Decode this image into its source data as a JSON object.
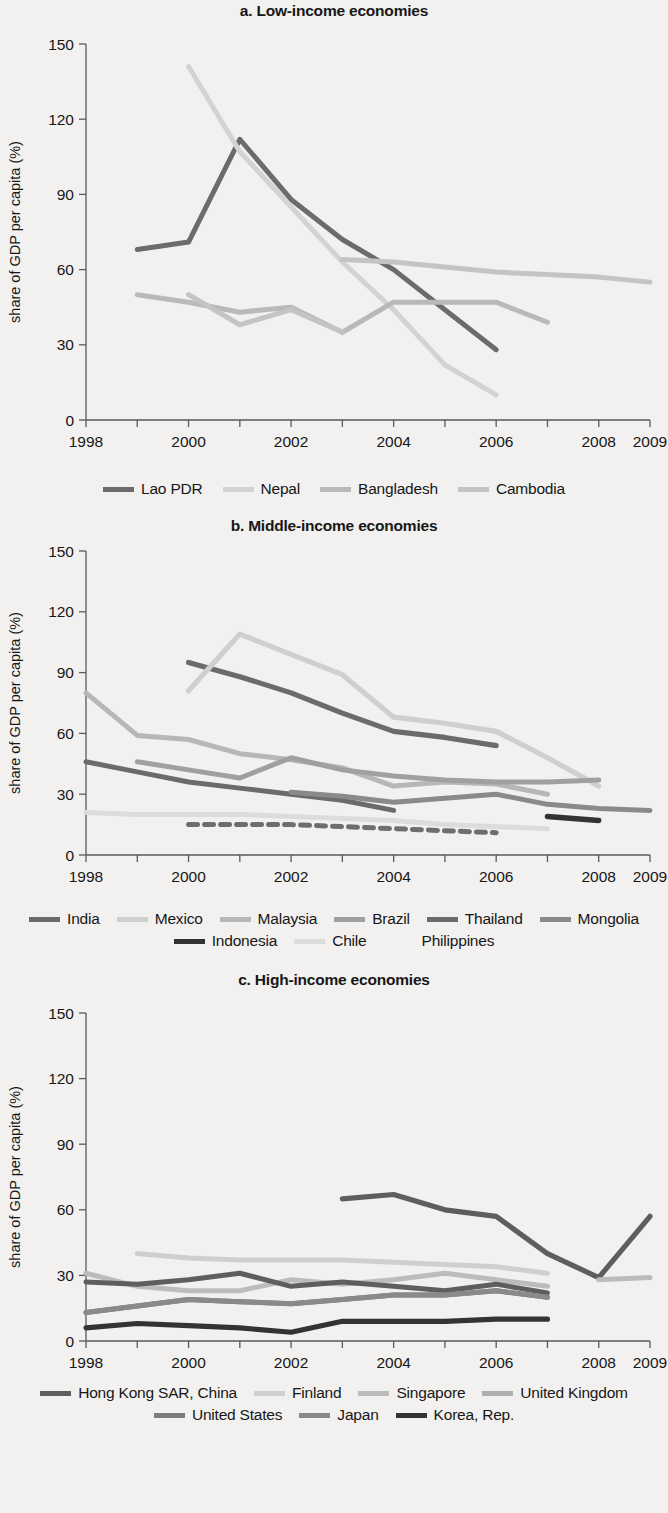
{
  "figure": {
    "y_axis_label": "share of GDP per capita (%)",
    "y_ticks": [
      "0",
      "30",
      "60",
      "90",
      "120",
      "150"
    ],
    "x_ticks": [
      "1998",
      "2000",
      "2002",
      "2004",
      "2006",
      "2008",
      "2009"
    ]
  },
  "chart_data": [
    {
      "type": "line",
      "title": "a. Low-income economies",
      "xlabel": "",
      "ylabel": "share of GDP per capita (%)",
      "xlim": [
        1998,
        2009
      ],
      "ylim": [
        0,
        150
      ],
      "ytick_values": [
        0,
        30,
        60,
        90,
        120,
        150
      ],
      "xtick_values": [
        1998,
        1999,
        2000,
        2001,
        2002,
        2003,
        2004,
        2005,
        2006,
        2007,
        2008,
        2009
      ],
      "xtick_labels": [
        "1998",
        "",
        "2000",
        "",
        "2002",
        "",
        "2004",
        "",
        "2006",
        "",
        "2008",
        "2009"
      ],
      "grid": false,
      "legend_position": "bottom",
      "series": [
        {
          "name": "Lao PDR",
          "color": "#6b6b6d",
          "style": "solid",
          "width": 5.0,
          "x": [
            1999,
            2000,
            2001,
            2002,
            2003,
            2004,
            2005,
            2006
          ],
          "values": [
            68,
            71,
            112,
            88,
            72,
            60,
            44,
            28
          ]
        },
        {
          "name": "Nepal",
          "color": "#d3d3d2",
          "style": "solid",
          "width": 5.0,
          "x": [
            2000,
            2001,
            2002,
            2003,
            2004,
            2005,
            2006
          ],
          "values": [
            141,
            107,
            85,
            63,
            44,
            22,
            10
          ]
        },
        {
          "name": "Bangladesh",
          "color": "#b9b9b8",
          "style": "solid",
          "width": 5.0,
          "x": [
            2003,
            2004,
            2005,
            2006,
            2007
          ],
          "values": [
            35,
            47,
            47,
            47,
            39
          ]
        },
        {
          "name": "Cambodia",
          "color": "#c4c4c3",
          "style": "solid",
          "width": 5.0,
          "x": [
            2003,
            2004,
            2005,
            2006,
            2007,
            2008,
            2009
          ],
          "values": [
            64,
            63,
            61,
            59,
            58,
            57,
            55
          ]
        },
        {
          "name": "Bangladesh-early",
          "color": "#b9b9b8",
          "style": "solid",
          "width": 5.0,
          "hidden_from_legend": true,
          "x": [
            1999,
            2000,
            2001,
            2002,
            2003
          ],
          "values": [
            50,
            47,
            43,
            45,
            35
          ]
        },
        {
          "name": "Cambodia-early",
          "color": "#c4c4c3",
          "style": "solid",
          "width": 5.0,
          "hidden_from_legend": true,
          "x": [
            2000,
            2001,
            2002,
            2003
          ],
          "values": [
            50,
            38,
            44,
            35
          ]
        }
      ],
      "legend": [
        {
          "label": "Lao PDR",
          "color": "#6b6b6d",
          "style": "solid"
        },
        {
          "label": "Nepal",
          "color": "#d3d3d2",
          "style": "solid"
        },
        {
          "label": "Bangladesh",
          "color": "#b9b9b8",
          "style": "solid"
        },
        {
          "label": "Cambodia",
          "color": "#c4c4c3",
          "style": "solid"
        }
      ]
    },
    {
      "type": "line",
      "title": "b. Middle-income economies",
      "xlabel": "",
      "ylabel": "share of GDP per capita (%)",
      "xlim": [
        1998,
        2009
      ],
      "ylim": [
        0,
        150
      ],
      "ytick_values": [
        0,
        30,
        60,
        90,
        120,
        150
      ],
      "xtick_values": [
        1998,
        1999,
        2000,
        2001,
        2002,
        2003,
        2004,
        2005,
        2006,
        2007,
        2008,
        2009
      ],
      "xtick_labels": [
        "1998",
        "",
        "2000",
        "",
        "2002",
        "",
        "2004",
        "",
        "2006",
        "",
        "2008",
        "2009"
      ],
      "grid": false,
      "legend_position": "bottom",
      "series": [
        {
          "name": "India",
          "color": "#6b6b6d",
          "style": "solid",
          "width": 5.2,
          "x": [
            2000,
            2001,
            2002,
            2003,
            2004,
            2005,
            2006
          ],
          "values": [
            95,
            88,
            80,
            70,
            61,
            58,
            54
          ]
        },
        {
          "name": "Mexico",
          "color": "#cfcfce",
          "style": "solid",
          "width": 5.2,
          "x": [
            2000,
            2001,
            2002,
            2003,
            2004,
            2005,
            2006,
            2007,
            2008
          ],
          "values": [
            81,
            109,
            99,
            89,
            68,
            65,
            61,
            48,
            34
          ]
        },
        {
          "name": "Malaysia",
          "color": "#b7b7b6",
          "style": "solid",
          "width": 5.0,
          "x": [
            1998,
            1999,
            2000,
            2001,
            2002,
            2003,
            2004,
            2005,
            2006,
            2007
          ],
          "values": [
            80,
            59,
            57,
            50,
            47,
            43,
            34,
            36,
            35,
            30
          ]
        },
        {
          "name": "Brazil",
          "color": "#a0a0a0",
          "style": "solid",
          "width": 5.0,
          "x": [
            1999,
            2000,
            2001,
            2002,
            2003,
            2004,
            2005,
            2006,
            2007,
            2008
          ],
          "values": [
            46,
            42,
            38,
            48,
            42,
            39,
            37,
            36,
            36,
            37
          ]
        },
        {
          "name": "Thailand",
          "color": "#6b6b6d",
          "style": "solid",
          "width": 5.0,
          "x": [
            1998,
            1999,
            2000,
            2001,
            2002,
            2003,
            2004
          ],
          "values": [
            46,
            41,
            36,
            33,
            30,
            27,
            22
          ]
        },
        {
          "name": "Mongolia",
          "color": "#8a8a8a",
          "style": "solid",
          "width": 5.0,
          "x": [
            2002,
            2003,
            2004,
            2005,
            2006,
            2007,
            2008,
            2009
          ],
          "values": [
            31,
            29,
            26,
            28,
            30,
            25,
            23,
            22
          ]
        },
        {
          "name": "Indonesia",
          "color": "#333334",
          "style": "solid",
          "width": 5.4,
          "x": [
            2007,
            2008
          ],
          "values": [
            19,
            17
          ]
        },
        {
          "name": "Chile",
          "color": "#dcdcdb",
          "style": "solid",
          "width": 5.0,
          "x": [
            1998,
            1999,
            2000,
            2001,
            2002,
            2003,
            2004,
            2005,
            2006,
            2007
          ],
          "values": [
            21,
            20,
            20,
            20,
            19,
            18,
            17,
            15,
            14,
            13
          ]
        },
        {
          "name": "Philippines",
          "color": "#6e6e70",
          "style": "dashed",
          "width": 5.0,
          "x": [
            2000,
            2001,
            2002,
            2003,
            2004,
            2005,
            2006
          ],
          "values": [
            15,
            15,
            15,
            14,
            13,
            12,
            11
          ]
        }
      ],
      "legend": [
        {
          "label": "India",
          "color": "#6b6b6d",
          "style": "solid"
        },
        {
          "label": "Mexico",
          "color": "#cfcfce",
          "style": "solid"
        },
        {
          "label": "Malaysia",
          "color": "#b7b7b6",
          "style": "solid"
        },
        {
          "label": "Brazil",
          "color": "#a0a0a0",
          "style": "solid"
        },
        {
          "label": "Thailand",
          "color": "#6b6b6d",
          "style": "solid"
        },
        {
          "label": "Mongolia",
          "color": "#8a8a8a",
          "style": "solid"
        },
        {
          "label": "Indonesia",
          "color": "#333334",
          "style": "solid"
        },
        {
          "label": "Chile",
          "color": "#dcdcdb",
          "style": "solid"
        },
        {
          "label": "Philippines",
          "color": "#6e6e70",
          "style": "dashed"
        }
      ]
    },
    {
      "type": "line",
      "title": "c. High-income economies",
      "xlabel": "",
      "ylabel": "share of GDP per capita (%)",
      "xlim": [
        1998,
        2009
      ],
      "ylim": [
        0,
        150
      ],
      "ytick_values": [
        0,
        30,
        60,
        90,
        120,
        150
      ],
      "xtick_values": [
        1998,
        1999,
        2000,
        2001,
        2002,
        2003,
        2004,
        2005,
        2006,
        2007,
        2008,
        2009
      ],
      "xtick_labels": [
        "1998",
        "",
        "2000",
        "",
        "2002",
        "",
        "2004",
        "",
        "2006",
        "",
        "2008",
        "2009"
      ],
      "grid": false,
      "legend_position": "bottom",
      "series": [
        {
          "name": "Hong Kong SAR, China",
          "color": "#5e5e60",
          "style": "solid",
          "width": 5.2,
          "x": [
            2003,
            2004,
            2005,
            2006,
            2007,
            2008,
            2009
          ],
          "values": [
            65,
            67,
            60,
            57,
            40,
            29,
            57
          ]
        },
        {
          "name": "Finland",
          "color": "#cfcfce",
          "style": "solid",
          "width": 5.0,
          "x": [
            1999,
            2000,
            2001,
            2002,
            2003,
            2004,
            2005,
            2006,
            2007
          ],
          "values": [
            40,
            38,
            37,
            37,
            37,
            36,
            35,
            34,
            31
          ]
        },
        {
          "name": "Singapore",
          "color": "#bcbcbb",
          "style": "solid",
          "width": 5.0,
          "x": [
            1998,
            1999,
            2000,
            2001,
            2002,
            2003,
            2004,
            2005,
            2006,
            2007
          ],
          "values": [
            31,
            25,
            23,
            23,
            28,
            26,
            28,
            31,
            28,
            25
          ]
        },
        {
          "name": "Singapore-late",
          "color": "#bcbcbb",
          "style": "solid",
          "width": 5.0,
          "hidden_from_legend": true,
          "x": [
            2008,
            2009
          ],
          "values": [
            28,
            29
          ]
        },
        {
          "name": "United Kingdom",
          "color": "#5e5e60",
          "style": "solid",
          "width": 5.0,
          "x": [
            1998,
            1999,
            2000,
            2001,
            2002,
            2003,
            2004,
            2005,
            2006,
            2007
          ],
          "values": [
            27,
            26,
            28,
            31,
            25,
            27,
            25,
            23,
            26,
            22
          ]
        },
        {
          "name": "United States",
          "color": "#7c7c7e",
          "style": "solid",
          "width": 5.0,
          "x": [
            1998,
            1999,
            2000,
            2001,
            2002,
            2003,
            2004,
            2005,
            2006,
            2007
          ],
          "values": [
            13,
            16,
            19,
            18,
            17,
            19,
            21,
            21,
            23,
            20
          ]
        },
        {
          "name": "Japan",
          "color": "#8a8a8a",
          "style": "solid",
          "width": 5.0,
          "x": [
            1998,
            1999,
            2000,
            2001,
            2002,
            2003,
            2004,
            2005,
            2006,
            2007
          ],
          "values": [
            13,
            16,
            19,
            18,
            17,
            19,
            21,
            21,
            23,
            20
          ]
        },
        {
          "name": "Korea, Rep.",
          "color": "#333334",
          "style": "solid",
          "width": 5.2,
          "x": [
            1998,
            1999,
            2000,
            2001,
            2002,
            2003,
            2004,
            2005,
            2006,
            2007
          ],
          "values": [
            6,
            8,
            7,
            6,
            4,
            9,
            9,
            9,
            10,
            10
          ]
        }
      ],
      "legend": [
        {
          "label": "Hong Kong SAR, China",
          "color": "#5e5e60",
          "style": "solid"
        },
        {
          "label": "Finland",
          "color": "#cfcfce",
          "style": "solid"
        },
        {
          "label": "Singapore",
          "color": "#bcbcbb",
          "style": "solid"
        },
        {
          "label": "United Kingdom",
          "color": "#b0b0af",
          "style": "solid"
        },
        {
          "label": "United States",
          "color": "#7c7c7e",
          "style": "solid"
        },
        {
          "label": "Japan",
          "color": "#8a8a8a",
          "style": "solid"
        },
        {
          "label": "Korea, Rep.",
          "color": "#333334",
          "style": "solid"
        }
      ]
    }
  ]
}
